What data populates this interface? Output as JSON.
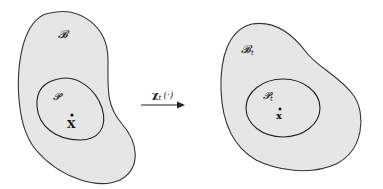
{
  "diagram": {
    "type": "continuum-deformation-map",
    "reference": {
      "body_label": "𝓑",
      "part_label": "𝓟",
      "point_label": "X"
    },
    "mapping": {
      "label_main": "χ",
      "label_sub": "t",
      "label_arg": "(·)"
    },
    "current": {
      "body_label": "𝓑",
      "body_sub": "t",
      "part_label": "𝓟",
      "part_sub": "t",
      "point_label": "x"
    },
    "colors": {
      "fill": "#e6e6e6",
      "stroke": "#333333"
    }
  }
}
